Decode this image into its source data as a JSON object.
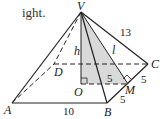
{
  "caption_fragment": "ight.",
  "diagram": {
    "type": "square pyramid",
    "vertices": {
      "apex": "V",
      "base": [
        "A",
        "B",
        "C",
        "D"
      ],
      "center": "O",
      "midpoint": "M"
    },
    "labels": {
      "V": "V",
      "A": "A",
      "B": "B",
      "C": "C",
      "D": "D",
      "O": "O",
      "M": "M",
      "h": "h",
      "l": "l"
    },
    "measurements": {
      "lateral_edge_VC": "13",
      "base_edge_AB": "10",
      "half_edge_BM": "5",
      "half_edge_MC": "5",
      "OM": "5"
    },
    "colors": {
      "shaded_triangle": "#d9d9d9",
      "lines": "#222222"
    }
  }
}
